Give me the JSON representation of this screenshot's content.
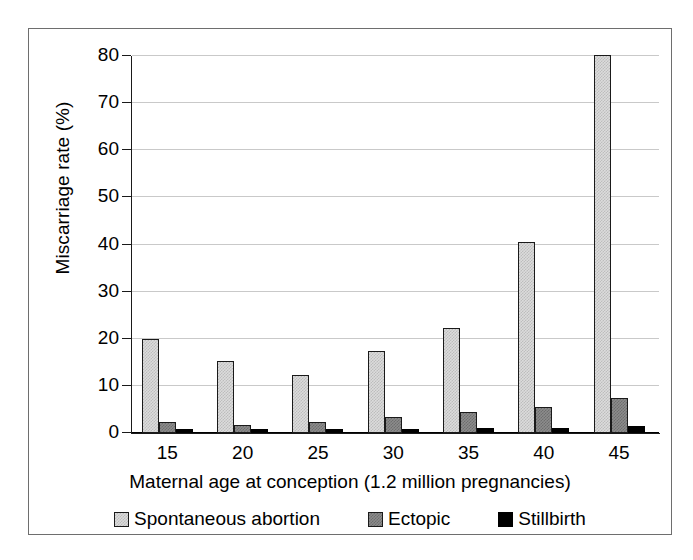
{
  "chart_data": {
    "type": "bar",
    "title": "",
    "subtitle": "",
    "xlabel": "Maternal age at conception (1.2 million pregnancies)",
    "ylabel": "Miscarriage rate (%)",
    "categories": [
      "15",
      "20",
      "25",
      "30",
      "35",
      "40",
      "45"
    ],
    "ylim": [
      0,
      80
    ],
    "yticks": [
      "0",
      "10",
      "20",
      "30",
      "40",
      "50",
      "60",
      "70",
      "80"
    ],
    "ytick_values": [
      0,
      10,
      20,
      30,
      40,
      50,
      60,
      70,
      80
    ],
    "grid": "horizontal",
    "legend_position": "bottom",
    "series": [
      {
        "name": "Spontaneous abortion",
        "color": "#dcdcdc",
        "values": [
          20.0,
          15.2,
          12.3,
          17.3,
          22.3,
          40.5,
          80.2
        ]
      },
      {
        "name": "Ectopic",
        "color": "#8c8c8c",
        "values": [
          2.3,
          1.8,
          2.3,
          3.3,
          4.5,
          5.6,
          7.4
        ]
      },
      {
        "name": "Stillbirth",
        "color": "#000000",
        "values": [
          0.8,
          0.8,
          0.8,
          0.9,
          1.0,
          1.1,
          1.4
        ]
      }
    ]
  }
}
